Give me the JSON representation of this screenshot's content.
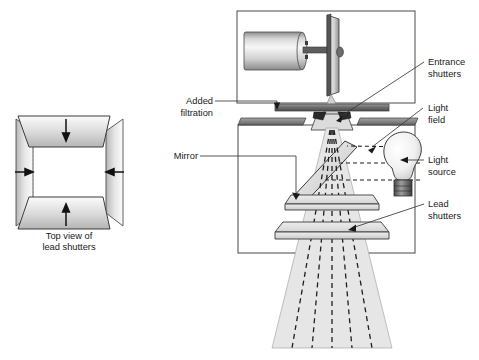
{
  "figure": {
    "type": "technical-cross-section-diagram",
    "background_color": "#ffffff",
    "line_color": "#333333",
    "metal_light": "#f2f2f2",
    "metal_mid": "#c9c9c9",
    "metal_dark": "#6e6e6e",
    "beam_fill": "#e3e3e3",
    "ray_color": "#1a1a1a"
  },
  "left_panel": {
    "caption_line1": "Top view of",
    "caption_line2": "lead shutters",
    "shutters": [
      {
        "position": "top",
        "arrow": "down"
      },
      {
        "position": "bottom",
        "arrow": "up"
      },
      {
        "position": "left",
        "arrow": "right"
      },
      {
        "position": "right",
        "arrow": "left"
      }
    ],
    "arrow_count": 4
  },
  "labels": {
    "added_filtration_l1": "Added",
    "added_filtration_l2": "filtration",
    "mirror": "Mirror",
    "entrance_shutters_l1": "Entrance",
    "entrance_shutters_l2": "shutters",
    "light_field_l1": "Light",
    "light_field_l2": "field",
    "light_source_l1": "Light",
    "light_source_l2": "source",
    "lead_shutters_l1": "Lead",
    "lead_shutters_l2": "shutters"
  },
  "components": {
    "tube_housing": "x-ray-tube-housing-box",
    "cathode_cylinder": "cathode-assembly",
    "anode_disc": "rotating-anode-disc",
    "collimator_housing": "collimator-box",
    "mirror": "angled-mirror",
    "light_bulb": "incandescent-light-source",
    "lead_shutter_plates": 2,
    "entrance_shutter_blades": 2,
    "filtration_bar": "added-filtration-plate",
    "beam_cone": "divergent-x-ray-beam",
    "dashed_beam_rays": 5,
    "light_rays": 3
  }
}
